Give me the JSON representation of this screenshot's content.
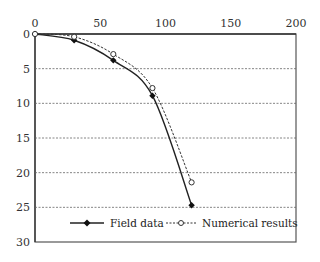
{
  "chart_data": {
    "type": "line",
    "title": "",
    "xlabel": "",
    "ylabel": "",
    "xlim": [
      0,
      200
    ],
    "ylim": [
      0,
      30
    ],
    "y_inverted": true,
    "x_axis_position": "top",
    "x_ticks": [
      0,
      50,
      100,
      150,
      200
    ],
    "y_ticks": [
      0,
      5,
      10,
      15,
      20,
      25,
      30
    ],
    "grid": {
      "horizontal": true,
      "style": "dashed",
      "vertical": false
    },
    "legend_position": "bottom-inside",
    "series": [
      {
        "name": "Field data",
        "style": "solid",
        "marker": "filled-diamond",
        "color": "#222222",
        "x": [
          0,
          30,
          60,
          90,
          120
        ],
        "y": [
          0,
          0.9,
          3.8,
          8.9,
          24.7
        ]
      },
      {
        "name": "Numerical results",
        "style": "dashed",
        "marker": "open-circle",
        "color": "#333333",
        "x": [
          0,
          30,
          60,
          90,
          120
        ],
        "y": [
          0,
          0.4,
          2.9,
          7.8,
          21.4
        ]
      }
    ]
  },
  "labels": {
    "x_ticks": [
      "0",
      "50",
      "100",
      "150",
      "200"
    ],
    "y_ticks": [
      "0",
      "5",
      "10",
      "15",
      "20",
      "25",
      "30"
    ],
    "legend": [
      "Field data",
      "Numerical results"
    ]
  }
}
